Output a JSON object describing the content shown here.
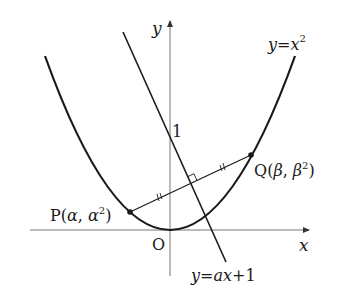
{
  "diagram": {
    "type": "coordinate-graph",
    "axes": {
      "x_label": "x",
      "y_label": "y",
      "origin_label": "O"
    },
    "curves": [
      {
        "name": "parabola",
        "equation_label": "y=x²",
        "lhs": "y",
        "eq": "=",
        "rhs": "x",
        "sup": "2"
      },
      {
        "name": "line",
        "equation_label": "y=ax+1",
        "lhs": "y",
        "eq": "=",
        "rhs": "ax",
        "plus": "+",
        "const": "1"
      }
    ],
    "y_intercept_label": "1",
    "points": [
      {
        "name": "P",
        "label": "P(α, α²)",
        "letter": "P",
        "open": "(",
        "a": "α",
        "comma": ", ",
        "b": "α",
        "sup": "2",
        "close": ")"
      },
      {
        "name": "Q",
        "label": "Q(β, β²)",
        "letter": "Q",
        "open": "(",
        "a": "β",
        "comma": ", ",
        "b": "β",
        "sup": "2",
        "close": ")"
      }
    ],
    "annotations": {
      "equal_segment_marks": "PM = MQ (double tick marks)",
      "right_angle": "segment PQ perpendicular to y=ax+1"
    },
    "colors": {
      "stroke": "#1a1a1a",
      "axis": "#777777",
      "background": "#ffffff"
    }
  }
}
